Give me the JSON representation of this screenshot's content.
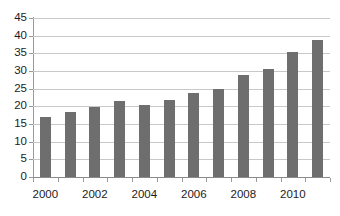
{
  "chart_data": {
    "type": "bar",
    "title": "",
    "subtitle": "",
    "xlabel": "",
    "ylabel": "",
    "categories": [
      "2000",
      "2001",
      "2002",
      "2003",
      "2004",
      "2005",
      "2006",
      "2007",
      "2008",
      "2009",
      "2010",
      "2011"
    ],
    "values": [
      17.1,
      18.4,
      19.8,
      21.5,
      20.3,
      21.8,
      23.8,
      24.9,
      29.0,
      30.6,
      35.4,
      38.7
    ],
    "series": [
      {
        "name": "Series 1",
        "values": [
          17.1,
          18.4,
          19.8,
          21.5,
          20.3,
          21.8,
          23.8,
          24.9,
          29.0,
          30.6,
          35.4,
          38.7
        ]
      }
    ],
    "ylim": [
      0,
      45
    ],
    "ytick_step": 5,
    "ytick_labels": [
      "45",
      "40",
      "35",
      "30",
      "25",
      "20",
      "15",
      "10",
      "5",
      "0"
    ],
    "ytick_values": [
      45,
      40,
      35,
      30,
      25,
      20,
      15,
      10,
      5,
      0
    ],
    "xtick_labels": [
      "2000",
      "2002",
      "2004",
      "2006",
      "2008",
      "2010"
    ],
    "xtick_label_indices": [
      0,
      2,
      4,
      6,
      8,
      10
    ],
    "grid": "horizontal",
    "legend": "none",
    "annotations": [],
    "colors": {
      "bar": "#6e6e6e",
      "gridline": "#c8c8c8",
      "axis": "#9a9a9a",
      "text": "#1c1c1c",
      "background": "#ffffff"
    }
  }
}
